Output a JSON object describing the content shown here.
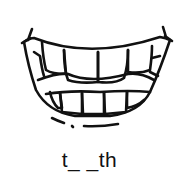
{
  "illustration": {
    "subject": "smiling mouth with teeth",
    "stroke_color": "#111111",
    "background": "#ffffff"
  },
  "word_prompt": {
    "text": "t_ _th"
  }
}
